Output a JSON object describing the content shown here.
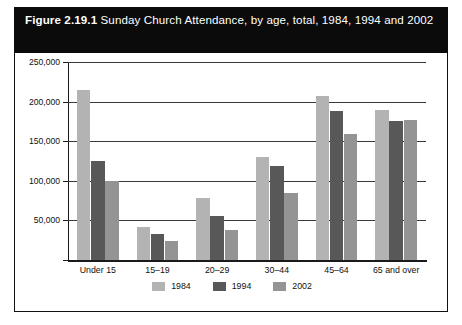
{
  "figure": {
    "number": "Figure 2.19.1",
    "title": "Sunday Church Attendance, by age, total, 1984, 1994 and 2002",
    "title_line1": "Figure 2.19.1 Sunday Church Attendance, by age, total,",
    "title_line2": "1984, 1994 and 2002",
    "figure_number_label": "Figure 2.19.1",
    "title_rest": " Sunday Church Attendance, by age, total, 1984, 1994 and 2002"
  },
  "colors": {
    "banner_bg": "#0b0b0b",
    "banner_text": "#ffffff",
    "panel_bg": "#ffffff",
    "border": "#111111",
    "series_1984": "#b3b3b3",
    "series_1994": "#585858",
    "series_2002": "#949494"
  },
  "chart_data": {
    "type": "bar",
    "title": "Figure 2.19.1 Sunday Church Attendance, by age, total, 1984, 1994 and 2002",
    "xlabel": "",
    "ylabel": "",
    "categories": [
      "Under 15",
      "15–19",
      "20–29",
      "30–44",
      "45–64",
      "65 and over"
    ],
    "series": [
      {
        "name": "1984",
        "color": "#b3b3b3",
        "values": [
          215000,
          42000,
          78000,
          130000,
          207000,
          190000
        ]
      },
      {
        "name": "1994",
        "color": "#585858",
        "values": [
          125000,
          33000,
          56000,
          119000,
          188000,
          176000
        ]
      },
      {
        "name": "2002",
        "color": "#949494",
        "values": [
          100000,
          24000,
          38000,
          84000,
          159000,
          177000
        ]
      }
    ],
    "ylim": [
      0,
      250000
    ],
    "yticks": [
      0,
      50000,
      100000,
      150000,
      200000,
      250000
    ],
    "ytick_labels": [
      "",
      "50,000",
      "100,000",
      "150,000",
      "200,000",
      "250,000"
    ],
    "grid": true,
    "legend_position": "bottom"
  }
}
